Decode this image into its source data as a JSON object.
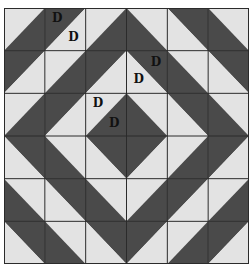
{
  "diagram": {
    "title": "",
    "rows": 6,
    "cols": 6,
    "colors": {
      "dark": "#4a4a4a",
      "light": "#e3e3e3",
      "grid": "#2b2b2b",
      "label": "#111111"
    },
    "cells": [
      [
        {
          "diag": "/",
          "dark": "BR"
        },
        {
          "diag": "/",
          "dark": "TL",
          "labels": {
            "TL": "D",
            "BR": "D"
          }
        },
        {
          "diag": "/",
          "dark": "BR"
        },
        {
          "diag": "\\",
          "dark": "BL"
        },
        {
          "diag": "\\",
          "dark": "TR"
        },
        {
          "diag": "\\",
          "dark": "BL"
        }
      ],
      [
        {
          "diag": "/",
          "dark": "TL"
        },
        {
          "diag": "/",
          "dark": "BR"
        },
        {
          "diag": "/",
          "dark": "TL"
        },
        {
          "diag": "\\",
          "dark": "TR",
          "labels": {
            "TR": "D",
            "BL": "D"
          }
        },
        {
          "diag": "\\",
          "dark": "BL"
        },
        {
          "diag": "\\",
          "dark": "TR"
        }
      ],
      [
        {
          "diag": "/",
          "dark": "BR"
        },
        {
          "diag": "/",
          "dark": "TL"
        },
        {
          "diag": "/",
          "dark": "BR",
          "labels": {
            "TL": "D",
            "BR": "D"
          }
        },
        {
          "diag": "\\",
          "dark": "BL"
        },
        {
          "diag": "\\",
          "dark": "TR"
        },
        {
          "diag": "\\",
          "dark": "BL"
        }
      ],
      [
        {
          "diag": "\\",
          "dark": "TR"
        },
        {
          "diag": "\\",
          "dark": "BL"
        },
        {
          "diag": "\\",
          "dark": "TR"
        },
        {
          "diag": "/",
          "dark": "TL"
        },
        {
          "diag": "/",
          "dark": "BR"
        },
        {
          "diag": "/",
          "dark": "TL"
        }
      ],
      [
        {
          "diag": "\\",
          "dark": "BL"
        },
        {
          "diag": "\\",
          "dark": "TR"
        },
        {
          "diag": "\\",
          "dark": "BL"
        },
        {
          "diag": "/",
          "dark": "BR"
        },
        {
          "diag": "/",
          "dark": "TL"
        },
        {
          "diag": "/",
          "dark": "BR"
        }
      ],
      [
        {
          "diag": "\\",
          "dark": "TR"
        },
        {
          "diag": "\\",
          "dark": "BL"
        },
        {
          "diag": "\\",
          "dark": "TR"
        },
        {
          "diag": "/",
          "dark": "TL"
        },
        {
          "diag": "/",
          "dark": "BR"
        },
        {
          "diag": "/",
          "dark": "TL"
        }
      ]
    ],
    "labels": [
      {
        "row": 0,
        "col": 1,
        "half": "TL",
        "text": "D"
      },
      {
        "row": 0,
        "col": 1,
        "half": "BR",
        "text": "D"
      },
      {
        "row": 1,
        "col": 3,
        "half": "TR",
        "text": "D"
      },
      {
        "row": 1,
        "col": 3,
        "half": "BL",
        "text": "D"
      },
      {
        "row": 2,
        "col": 2,
        "half": "TL",
        "text": "D"
      },
      {
        "row": 2,
        "col": 2,
        "half": "BR",
        "text": "D"
      }
    ]
  }
}
